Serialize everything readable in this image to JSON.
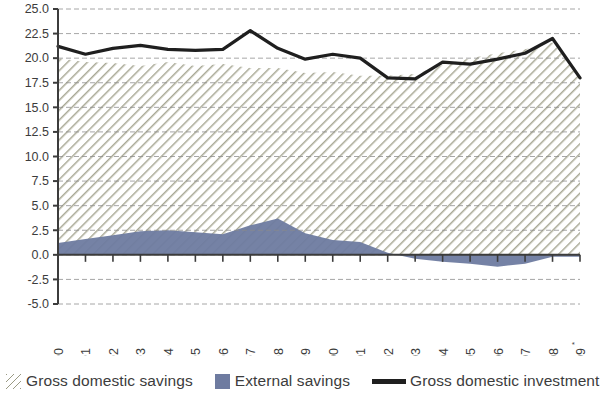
{
  "chart_data": {
    "type": "area",
    "title": "",
    "subtitle": "",
    "xlabel": "",
    "ylabel": "",
    "categories": [
      "1990",
      "1991",
      "1992",
      "1993",
      "1994",
      "1995",
      "1996",
      "1997",
      "1998",
      "1999",
      "2000",
      "2001",
      "2002",
      "2003",
      "2004",
      "2005",
      "2006",
      "2007",
      "2008",
      "2009"
    ],
    "x_tick_labels": [
      "1990",
      "1991",
      "1992",
      "1993",
      "1994",
      "1995",
      "1996",
      "1997",
      "1998",
      "1999",
      "2000",
      "2001",
      "2002",
      "2003",
      "2004",
      "2005",
      "2006",
      "2007",
      "2008",
      "2009"
    ],
    "x_last_label_marker": "*",
    "y_tick_labels": [
      "25.0",
      "22.5",
      "20.0",
      "17.5",
      "15.0",
      "12.5",
      "10.0",
      "7.5",
      "5.0",
      "2.5",
      "0.0",
      "-2.5",
      "-5.0"
    ],
    "y_tick_values": [
      25.0,
      22.5,
      20.0,
      17.5,
      15.0,
      12.5,
      10.0,
      7.5,
      5.0,
      2.5,
      0.0,
      -2.5,
      -5.0
    ],
    "ylim": [
      -5.0,
      25.0
    ],
    "grid": true,
    "grid_style": "dashed-horizontal",
    "legend_position": "bottom-left",
    "series": [
      {
        "name": "Gross domestic savings",
        "type": "area",
        "style": "diagonal-hatch",
        "color": "#9a9a84",
        "values": [
          20.0,
          19.6,
          19.5,
          19.2,
          19.6,
          19.2,
          19.4,
          19.0,
          19.0,
          18.5,
          18.6,
          18.2,
          18.2,
          18.4,
          19.3,
          20.0,
          20.5,
          20.9,
          21.6,
          18.2
        ]
      },
      {
        "name": "External savings",
        "type": "area",
        "style": "solid-fill",
        "color": "#6e7ba0",
        "values": [
          1.2,
          1.6,
          2.0,
          2.4,
          2.5,
          2.3,
          2.1,
          3.0,
          3.7,
          2.2,
          1.5,
          1.3,
          0.2,
          -0.4,
          -0.7,
          -0.9,
          -1.2,
          -0.9,
          -0.2,
          -0.2
        ]
      },
      {
        "name": "Gross domestic investment",
        "type": "line",
        "style": "thick-line",
        "color": "#1f1f1f",
        "values": [
          21.2,
          20.4,
          21.0,
          21.3,
          20.9,
          20.8,
          20.9,
          22.8,
          21.0,
          19.9,
          20.4,
          20.0,
          18.0,
          17.9,
          19.6,
          19.4,
          19.9,
          20.5,
          22.0,
          18.0
        ]
      }
    ]
  },
  "legend": {
    "items": [
      {
        "label": "Gross domestic savings",
        "marker": "hatch-swatch"
      },
      {
        "label": "External savings",
        "marker": "blue-swatch"
      },
      {
        "label": "Gross domestic investment",
        "marker": "black-line-swatch"
      }
    ]
  },
  "colors": {
    "hatch": "#9a9a84",
    "external_savings": "#6e7ba0",
    "investment_line": "#1f1f1f",
    "axis": "#3c3c3c",
    "grid": "#8a8a8a",
    "background": "#ffffff"
  }
}
